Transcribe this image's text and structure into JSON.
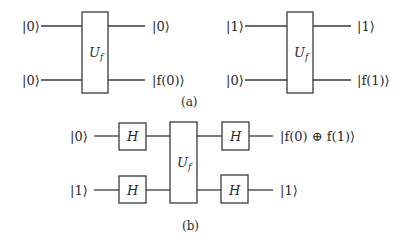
{
  "figure": {
    "panel_a": {
      "caption": "(a)",
      "left_circuit": {
        "inputs": [
          "|0⟩",
          "|0⟩"
        ],
        "gate": "U",
        "gate_subscript": "f",
        "outputs": [
          "|0⟩",
          "|f(0)⟩"
        ]
      },
      "right_circuit": {
        "inputs": [
          "|1⟩",
          "|0⟩"
        ],
        "gate": "U",
        "gate_subscript": "f",
        "outputs": [
          "|1⟩",
          "|f(1)⟩"
        ]
      }
    },
    "panel_b": {
      "caption": "(b)",
      "inputs": [
        "|0⟩",
        "|1⟩"
      ],
      "pre_gates": [
        "H",
        "H"
      ],
      "gate": "U",
      "gate_subscript": "f",
      "post_gates": [
        "H",
        "H"
      ],
      "outputs": [
        "|f(0) ⊕ f(1)⟩",
        "|1⟩"
      ]
    }
  }
}
